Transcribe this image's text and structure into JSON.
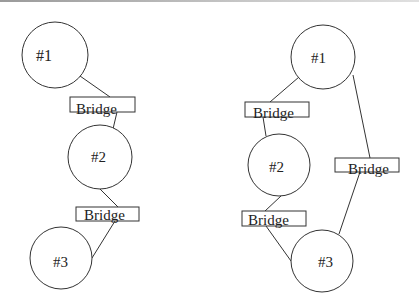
{
  "colors": {
    "stroke": "#333333",
    "background": "#ffffff",
    "text": "#222222"
  },
  "diagrams": [
    {
      "name": "left-chain",
      "nodes": [
        {
          "id": "n1",
          "label": "#1",
          "cx": 55,
          "cy": 55,
          "r": 33
        },
        {
          "id": "n2",
          "label": "#2",
          "cx": 100,
          "cy": 157,
          "r": 32
        },
        {
          "id": "n3",
          "label": "#3",
          "cx": 61,
          "cy": 258,
          "r": 31
        }
      ],
      "bridges": [
        {
          "label": "Bridge",
          "x": 70,
          "y": 97,
          "w": 65,
          "h": 15
        },
        {
          "label": "Bridge",
          "x": 76,
          "y": 207,
          "w": 63,
          "h": 14
        }
      ]
    },
    {
      "name": "right-triangle",
      "nodes": [
        {
          "id": "n1",
          "label": "#1",
          "cx": 323,
          "cy": 57,
          "r": 32
        },
        {
          "id": "n2",
          "label": "#2",
          "cx": 279,
          "cy": 165,
          "r": 31
        },
        {
          "id": "n3",
          "label": "#3",
          "cx": 322,
          "cy": 261,
          "r": 31
        }
      ],
      "bridges": [
        {
          "label": "Bridge",
          "x": 245,
          "y": 102,
          "w": 64,
          "h": 15
        },
        {
          "label": "Bridge",
          "x": 335,
          "y": 158,
          "w": 64,
          "h": 14
        },
        {
          "label": "Bridge",
          "x": 242,
          "y": 211,
          "w": 64,
          "h": 15
        }
      ]
    }
  ],
  "labels": {
    "left_n1": "#1",
    "left_n2": "#2",
    "left_n3": "#3",
    "left_b1": "Bridge",
    "left_b2": "Bridge",
    "right_n1": "#1",
    "right_n2": "#2",
    "right_n3": "#3",
    "right_b1": "Bridge",
    "right_b2": "Bridge",
    "right_b3": "Bridge"
  }
}
